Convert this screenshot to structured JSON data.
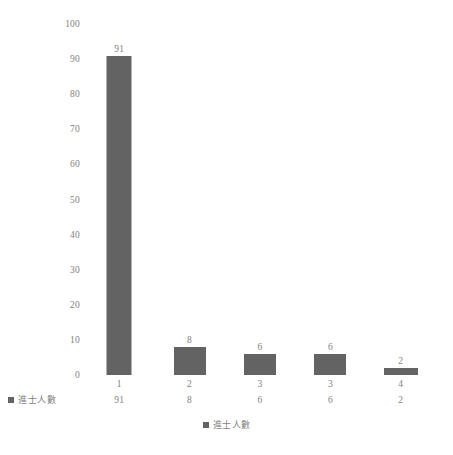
{
  "chart_data": {
    "type": "bar",
    "title": "",
    "subtitle": "",
    "xlabel": "",
    "ylabel": "",
    "categories": [
      "1",
      "2",
      "3",
      "3",
      "4"
    ],
    "values": [
      91,
      8,
      6,
      6,
      2
    ],
    "series": [
      {
        "name": "進士人數",
        "values": [
          91,
          8,
          6,
          6,
          2
        ]
      }
    ],
    "data_labels": [
      "91",
      "8",
      "6",
      "6",
      "2"
    ],
    "ylim": [
      0,
      100
    ],
    "ytick_labels": [
      "100",
      "90",
      "80",
      "70",
      "60",
      "50",
      "40",
      "30",
      "20",
      "10",
      "0"
    ],
    "ytick_values": [
      100,
      90,
      80,
      70,
      60,
      50,
      40,
      30,
      20,
      10,
      0
    ],
    "grid": false,
    "legend_position": "bottom",
    "legend_entries": [
      "進士人數"
    ],
    "bar_color": "#636363",
    "text_color": "#7f7f7f",
    "background_color": "#ffffff",
    "data_table_visible": true,
    "data_table": {
      "category_row": [
        "1",
        "2",
        "3",
        "3",
        "4"
      ],
      "series_label": "進士人數",
      "series_row": [
        "91",
        "8",
        "6",
        "6",
        "2"
      ]
    }
  }
}
